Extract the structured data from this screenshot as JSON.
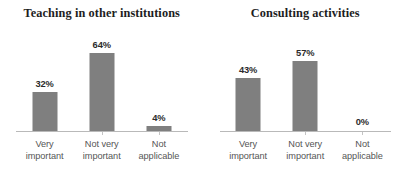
{
  "chart_data": [
    {
      "type": "bar",
      "title": "Teaching in other institutions",
      "categories": [
        "Very important",
        "Not very important",
        "Not applicable"
      ],
      "category_lines": [
        [
          "Very",
          "important"
        ],
        [
          "Not very",
          "important"
        ],
        [
          "Not",
          "applicable"
        ]
      ],
      "values": [
        32,
        64,
        4
      ],
      "value_labels": [
        "32%",
        "64%",
        "4%"
      ],
      "xlabel": "",
      "ylabel": "",
      "ylim": [
        0,
        80
      ],
      "grid": false,
      "legend": "none",
      "bar_color": "#7f7f7f",
      "axis_color": "#b9b9b9"
    },
    {
      "type": "bar",
      "title": "Consulting activities",
      "categories": [
        "Very important",
        "Not very important",
        "Not applicable"
      ],
      "category_lines": [
        [
          "Very",
          "important"
        ],
        [
          "Not very",
          "important"
        ],
        [
          "Not",
          "applicable"
        ]
      ],
      "values": [
        43,
        57,
        0
      ],
      "value_labels": [
        "43%",
        "57%",
        "0%"
      ],
      "xlabel": "",
      "ylabel": "",
      "ylim": [
        0,
        80
      ],
      "grid": false,
      "legend": "none",
      "bar_color": "#7f7f7f",
      "axis_color": "#b9b9b9"
    }
  ]
}
